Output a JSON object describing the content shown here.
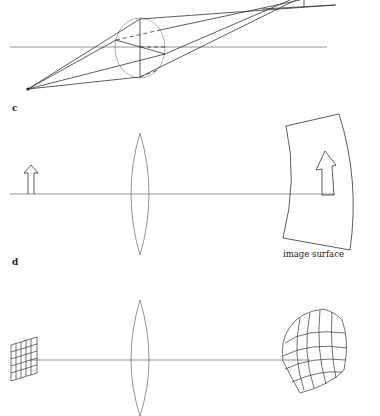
{
  "figure": {
    "colors": {
      "line": "#333333",
      "axis": "#555555",
      "background": "#ffffff"
    },
    "panels": [
      {
        "id": "b",
        "label": "",
        "content": "Point source off-axis; rays pass through a spherical lens and converge to the upper right (coma/astigmatism)"
      },
      {
        "id": "c",
        "label": "c",
        "content": "Upright object arrow imaged by a biconvex lens onto a curved image surface",
        "caption": "image surface"
      },
      {
        "id": "d",
        "label": "d",
        "content": "Flat square grid imaged through a lens appears as a curved, distorted grid"
      }
    ]
  },
  "labels": {
    "panel_c": "c",
    "panel_d": "d",
    "image_surface": "image surface"
  }
}
